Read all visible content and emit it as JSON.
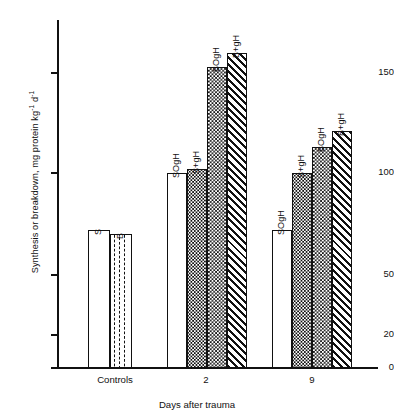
{
  "chart_data": {
    "type": "bar",
    "title": "",
    "xlabel": "Days after trauma",
    "ylabel": "Synthesis or breakdown, mg protein kg⁻¹ d⁻¹",
    "ylabel_parts": {
      "main": "Synthesis or breakdown, mg protein kg",
      "sup1": "-1",
      "mid": " d",
      "sup2": "-1"
    },
    "ylim": [
      0,
      175
    ],
    "yticks": [
      0,
      20,
      50,
      100,
      150
    ],
    "ytick_labels": [
      "0",
      "20",
      "50",
      "100",
      "150"
    ],
    "grid": false,
    "legend": "none",
    "categories": [
      "Controls",
      "2",
      "9"
    ],
    "groups": [
      {
        "category": "Controls",
        "bars": [
          {
            "label": "S",
            "value": 72,
            "pattern": "open"
          },
          {
            "label": "B",
            "value": 70,
            "pattern": "dashed-vertical"
          }
        ]
      },
      {
        "category": "2",
        "bars": [
          {
            "label": "SOgH",
            "value": 100,
            "pattern": "open"
          },
          {
            "label": "S+gH",
            "value": 102,
            "pattern": "stipple"
          },
          {
            "label": "BOgH",
            "value": 153,
            "pattern": "checker"
          },
          {
            "label": "B+gH",
            "value": 160,
            "pattern": "hatch"
          }
        ]
      },
      {
        "category": "9",
        "bars": [
          {
            "label": "SOgH",
            "value": 72,
            "pattern": "open"
          },
          {
            "label": "S+gH",
            "value": 100,
            "pattern": "stipple"
          },
          {
            "label": "BOgH",
            "value": 113,
            "pattern": "checker"
          },
          {
            "label": "B+gH",
            "value": 121,
            "pattern": "hatch"
          }
        ]
      }
    ],
    "colors": {
      "ink": "#111111",
      "background": "#ffffff"
    }
  }
}
